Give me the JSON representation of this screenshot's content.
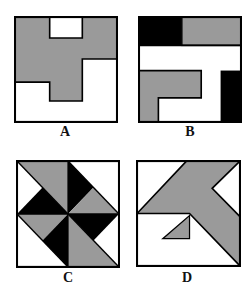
{
  "figure": {
    "colors": {
      "gray": "#9a9a9a",
      "black": "#000000",
      "white": "#ffffff",
      "stroke": "#000000"
    },
    "panels": [
      {
        "id": "A",
        "label": "A"
      },
      {
        "id": "B",
        "label": "B"
      },
      {
        "id": "C",
        "label": "C"
      },
      {
        "id": "D",
        "label": "D"
      }
    ]
  }
}
